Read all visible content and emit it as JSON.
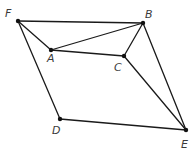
{
  "diagram": {
    "type": "geometry-figure",
    "points": {
      "F": {
        "label": "F",
        "x": 18,
        "y": 21,
        "lx": 5,
        "ly": 17
      },
      "B": {
        "label": "B",
        "x": 143,
        "y": 23,
        "lx": 145,
        "ly": 18
      },
      "A": {
        "label": "A",
        "x": 51,
        "y": 50,
        "lx": 47,
        "ly": 62
      },
      "C": {
        "label": "C",
        "x": 124,
        "y": 56,
        "lx": 114,
        "ly": 71
      },
      "D": {
        "label": "D",
        "x": 60,
        "y": 119,
        "lx": 52,
        "ly": 134
      },
      "E": {
        "label": "E",
        "x": 186,
        "y": 130,
        "lx": 181,
        "ly": 148
      }
    },
    "segments": [
      [
        "F",
        "B"
      ],
      [
        "F",
        "A"
      ],
      [
        "A",
        "B"
      ],
      [
        "A",
        "C"
      ],
      [
        "C",
        "B"
      ],
      [
        "F",
        "D"
      ],
      [
        "D",
        "E"
      ],
      [
        "B",
        "E"
      ],
      [
        "C",
        "E"
      ]
    ]
  }
}
